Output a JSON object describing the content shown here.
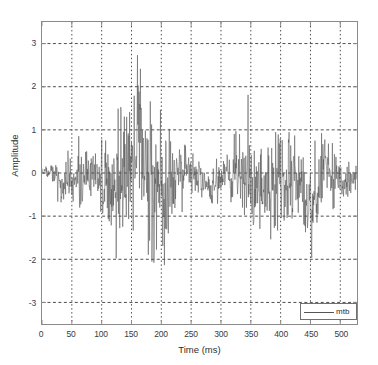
{
  "chart_data": {
    "type": "line",
    "title": "",
    "xlabel": "Time (ms)",
    "ylabel": "Amplitude",
    "xlim": [
      0,
      528
    ],
    "ylim": [
      -3.5,
      3.5
    ],
    "grid": true,
    "grid_style": "dotted",
    "legend_position": "lower right",
    "xticks": [
      0,
      50,
      100,
      150,
      200,
      250,
      300,
      350,
      400,
      450,
      500
    ],
    "xtick_labels": [
      "0",
      "50",
      "100",
      "150",
      "200",
      "250",
      "300",
      "350",
      "400",
      "450",
      "500"
    ],
    "yticks": [
      3,
      2,
      1,
      0,
      -1,
      -2,
      -3
    ],
    "ytick_labels": [
      "3",
      "2",
      "1",
      "0",
      "-1",
      "-2",
      "-3"
    ],
    "series": [
      {
        "name": "mtb",
        "color": "#555555",
        "description": "Dense seismic-style noise record; quiet onset 0-40 ms, growing coda peaking near 165 ms at amplitude 3.1, secondary bursts near 345 ms and 415 ms, minimum about -2.8 near 210 ms.",
        "x_sample_step_ms": 0.55,
        "envelope_markers": [
          {
            "t": 0,
            "max": 0.12,
            "min": -0.12
          },
          {
            "t": 15,
            "max": 0.2,
            "min": -0.55
          },
          {
            "t": 25,
            "max": 0.18,
            "min": -0.62
          },
          {
            "t": 35,
            "max": 0.3,
            "min": -0.95
          },
          {
            "t": 45,
            "max": 0.6,
            "min": -0.75
          },
          {
            "t": 55,
            "max": 0.85,
            "min": -0.7
          },
          {
            "t": 65,
            "max": 0.95,
            "min": -1.0
          },
          {
            "t": 75,
            "max": 1.0,
            "min": -0.85
          },
          {
            "t": 85,
            "max": 0.9,
            "min": -0.8
          },
          {
            "t": 95,
            "max": 0.8,
            "min": -1.05
          },
          {
            "t": 105,
            "max": 1.25,
            "min": -1.5
          },
          {
            "t": 115,
            "max": 2.6,
            "min": -1.7
          },
          {
            "t": 125,
            "max": 1.5,
            "min": -2.2
          },
          {
            "t": 135,
            "max": 1.6,
            "min": -1.9
          },
          {
            "t": 145,
            "max": 2.1,
            "min": -2.15
          },
          {
            "t": 155,
            "max": 2.45,
            "min": -1.8
          },
          {
            "t": 165,
            "max": 3.1,
            "min": -2.0
          },
          {
            "t": 175,
            "max": 2.35,
            "min": -1.9
          },
          {
            "t": 185,
            "max": 1.6,
            "min": -2.1
          },
          {
            "t": 195,
            "max": 2.05,
            "min": -2.3
          },
          {
            "t": 205,
            "max": 1.4,
            "min": -2.75
          },
          {
            "t": 215,
            "max": 1.55,
            "min": -2.1
          },
          {
            "t": 225,
            "max": 1.0,
            "min": -1.3
          },
          {
            "t": 235,
            "max": 0.7,
            "min": -1.0
          },
          {
            "t": 245,
            "max": 0.6,
            "min": -0.9
          },
          {
            "t": 255,
            "max": 0.8,
            "min": -0.6
          },
          {
            "t": 265,
            "max": 0.55,
            "min": -0.85
          },
          {
            "t": 275,
            "max": 0.25,
            "min": -0.8
          },
          {
            "t": 285,
            "max": 0.2,
            "min": -0.75
          },
          {
            "t": 295,
            "max": 0.45,
            "min": -0.8
          },
          {
            "t": 305,
            "max": 0.5,
            "min": -0.55
          },
          {
            "t": 315,
            "max": 0.9,
            "min": -0.8
          },
          {
            "t": 325,
            "max": 1.0,
            "min": -0.95
          },
          {
            "t": 335,
            "max": 1.1,
            "min": -1.0
          },
          {
            "t": 345,
            "max": 1.9,
            "min": -1.25
          },
          {
            "t": 355,
            "max": 1.1,
            "min": -1.35
          },
          {
            "t": 365,
            "max": 1.15,
            "min": -1.3
          },
          {
            "t": 375,
            "max": 1.0,
            "min": -1.5
          },
          {
            "t": 385,
            "max": 1.05,
            "min": -1.6
          },
          {
            "t": 395,
            "max": 1.6,
            "min": -1.45
          },
          {
            "t": 405,
            "max": 1.45,
            "min": -1.2
          },
          {
            "t": 415,
            "max": 1.95,
            "min": -1.35
          },
          {
            "t": 425,
            "max": 1.5,
            "min": -1.3
          },
          {
            "t": 435,
            "max": 1.0,
            "min": -1.25
          },
          {
            "t": 445,
            "max": 0.8,
            "min": -1.8
          },
          {
            "t": 455,
            "max": 0.75,
            "min": -2.05
          },
          {
            "t": 465,
            "max": 0.9,
            "min": -1.2
          },
          {
            "t": 475,
            "max": 1.15,
            "min": -0.85
          },
          {
            "t": 485,
            "max": 0.95,
            "min": -0.9
          },
          {
            "t": 495,
            "max": 0.85,
            "min": -0.7
          },
          {
            "t": 505,
            "max": 0.55,
            "min": -0.6
          },
          {
            "t": 515,
            "max": 0.45,
            "min": -0.55
          },
          {
            "t": 528,
            "max": 0.3,
            "min": -0.35
          }
        ]
      }
    ]
  },
  "axes": {
    "ylabel": "Amplitude",
    "xlabel": "Time (ms)"
  },
  "legend": {
    "entries": [
      {
        "label": "mtb",
        "color": "#555555"
      }
    ]
  },
  "colors": {
    "series": "#555555",
    "axis": "#8a8a8a",
    "grid": "#4d4d4d",
    "text": "#2e2e2e",
    "background": "#ffffff"
  }
}
